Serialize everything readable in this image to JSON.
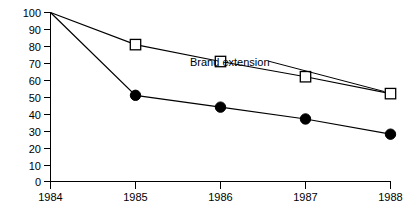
{
  "chart_data": {
    "type": "line",
    "title": "",
    "subtitle": "",
    "xlabel": "",
    "ylabel": "",
    "categories": [
      "1984",
      "1985",
      "1986",
      "1987",
      "1988"
    ],
    "x": [
      1984,
      1985,
      1986,
      1987,
      1988
    ],
    "xlim": [
      1984,
      1988
    ],
    "ylim": [
      0,
      100
    ],
    "grid": false,
    "legend_position": "inline-annotation",
    "y_ticks": [
      0,
      10,
      20,
      30,
      40,
      50,
      60,
      70,
      80,
      90,
      100
    ],
    "y_tick_labels": [
      "0",
      "10",
      "20",
      "30",
      "40",
      "50",
      "60",
      "70",
      "80",
      "90",
      "100"
    ],
    "x_ticks": [
      1984,
      1985,
      1986,
      1987,
      1988
    ],
    "x_tick_labels": [
      "1984",
      "1985",
      "1986",
      "1987",
      "1988"
    ],
    "series": [
      {
        "name": "Brand extension",
        "marker": "open-square",
        "values": [
          100,
          81,
          71,
          62,
          52
        ]
      },
      {
        "name": "New brand",
        "marker": "filled-circle",
        "values": [
          100,
          51,
          44,
          37,
          28
        ]
      }
    ],
    "annotations": [
      {
        "text": "Brand extension",
        "points_to_series": "Brand extension",
        "points_to_x": 1988,
        "points_to_y": 52
      }
    ],
    "colors": {
      "axis": "#000000",
      "line": "#000000",
      "marker_fill": "#000000",
      "marker_open_fill": "#ffffff",
      "background": "#ffffff"
    }
  }
}
